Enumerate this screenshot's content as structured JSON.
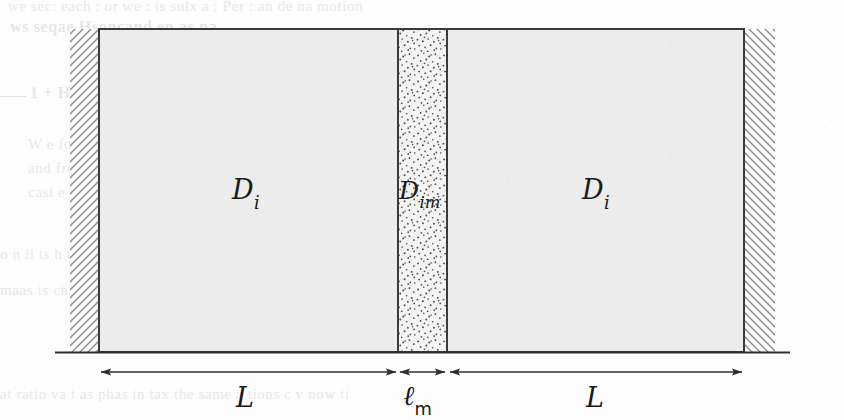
{
  "figure": {
    "regions": [
      {
        "id": "left-compartment",
        "label_D": "D",
        "label_sub": "i",
        "fill": "#ececec",
        "texture": "plain"
      },
      {
        "id": "membrane",
        "label_D": "D",
        "label_sub": "im",
        "fill": "#f2f2f2",
        "texture": "stipple"
      },
      {
        "id": "right-compartment",
        "label_D": "D",
        "label_sub": "i",
        "fill": "#ececec",
        "texture": "plain"
      }
    ],
    "dimensions": [
      {
        "id": "left-length",
        "symbol": "L",
        "sub": "",
        "arrow": "double-headed"
      },
      {
        "id": "membrane-length",
        "symbol": "ℓ",
        "sub": "m",
        "arrow": "double-headed"
      },
      {
        "id": "right-length",
        "symbol": "L",
        "sub": "",
        "arrow": "double-headed"
      }
    ],
    "walls": [
      {
        "id": "left-wall",
        "hatch_direction": "forward-slash"
      },
      {
        "id": "right-wall",
        "hatch_direction": "back-slash"
      }
    ],
    "colors": {
      "line": "#3a3a3a",
      "compartment_fill": "#ececec",
      "membrane_fill": "#f2f2f2",
      "hatch": "#9a9a9a",
      "stipple": "#555555",
      "paper": "#fdfdfd"
    }
  },
  "labels": {
    "left_D": "D",
    "left_D_sub": "i",
    "membrane_D": "D",
    "membrane_D_sub": "im",
    "right_D": "D",
    "right_D_sub": "i",
    "left_L": "L",
    "membrane_ell": "ℓ",
    "membrane_ell_sub": "m",
    "right_L": "L"
  },
  "bleed_through": {
    "note": "Faint mirrored text showing through from the reverse side of the printed page; illegible.",
    "top_line_1": "we sec: each : or we : is  sulx a  ;  Per  : an  de na  motion",
    "top_line_2": "ws    seqae   Hsoncand  en as  na",
    "heading": "1 + Hemi nversa  ss y  arium",
    "body_1": "W  e  for cs  a  a  om  The  esque  sur t  o  o in  e  o  ussed",
    "body_2": "and  from  th  p   o  c    w  x  a  a     e  n    the",
    "body_3": "casi  e  u  e  p  e  or  e  a",
    "body_4": "atomo",
    "body_5": "o n ll  ts   h tt  to  oo  re   a  Una rect  a  c  the cir  cy  quilibr",
    "body_6": "maas  is cha  ci ypoint  com  to  a  ra  so  no  action  process  one  W",
    "body_7": "at  ratio va  t  as   phas  in  tax    the  same  a  tions   c  v  now  ti"
  }
}
